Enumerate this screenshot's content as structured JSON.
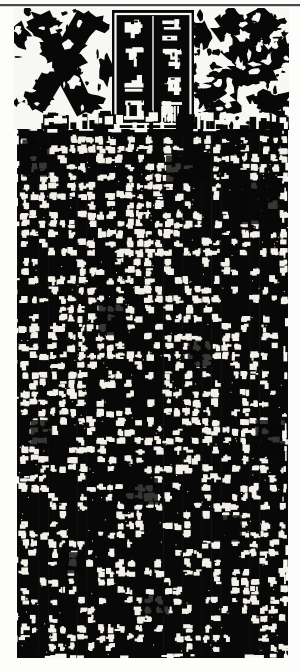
{
  "plate": {
    "kind": "stele-rubbing-photographic-plate",
    "medium": "ink rubbing of carved stone stele",
    "orientation": "portrait",
    "page_background": "#fdfdfb",
    "ink_color": "#080808",
    "paper_color": "#f7f7f4",
    "top_rule": {
      "visible": true,
      "color": "#2a2a2a",
      "thickness_px": 2
    }
  },
  "header": {
    "name": "stele-head",
    "description": "ornamented stele head with central title cartouche flanked by mirrored interlaced dragon ornaments",
    "left_ornament": {
      "name": "dragon-ornament-left",
      "motif": "bold crossing X-shaped interlaced dragon body"
    },
    "right_ornament": {
      "name": "dragon-ornament-right",
      "motif": "mirrored mottled interlaced dragon and cloud scroll"
    },
    "cartouche": {
      "name": "title-cartouche",
      "border": "incised rectangular frame",
      "columns": [
        {
          "name": "title-column-right",
          "glyphs": [
            "█",
            "█",
            "█",
            "█"
          ],
          "glyph_count": 4
        },
        {
          "name": "title-column-left",
          "glyphs": [
            "█",
            "█",
            "█",
            "█"
          ],
          "glyph_count": 4
        }
      ],
      "script": "seal script (zhuanshu), heavily eroded"
    }
  },
  "body": {
    "name": "inscription-body",
    "description": "dense black rubbing field of the stele face; eroded characters read as small pale marks on a regular ruled grid",
    "background": "#080808",
    "mark_color": "#f2f0e8",
    "script": "clerical/regular script, heavily weathered",
    "grid": {
      "columns": 28,
      "rows": 56,
      "column_pitch_px": 9.6,
      "row_pitch_px": 9.4,
      "legible_fraction": 0.46
    },
    "damage": {
      "worn_patches": true,
      "edges": "irregular, frayed at upper-right and lower-right corners"
    }
  },
  "colors": {
    "ink": "#080808",
    "paper": "#fdfdfb",
    "mark": "#f2f0e8",
    "rule": "#2a2a2a"
  }
}
